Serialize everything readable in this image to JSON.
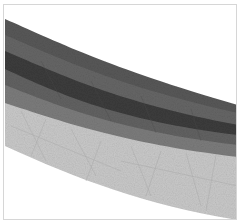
{
  "image": {
    "description": "Curved layered grayscale strata band",
    "width": 242,
    "height": 224
  },
  "frame": {
    "border_color": "#d6d6d6",
    "background": "#ffffff"
  },
  "layers": [
    {
      "name": "top-band",
      "color": "#585858"
    },
    {
      "name": "upper-mid-band",
      "color": "#666666"
    },
    {
      "name": "dark-band",
      "color": "#3c3c3c"
    },
    {
      "name": "lower-mid-band",
      "color": "#626262"
    },
    {
      "name": "gray-band",
      "color": "#7c7c7c"
    },
    {
      "name": "light-band",
      "color": "#c9c9c9"
    }
  ]
}
